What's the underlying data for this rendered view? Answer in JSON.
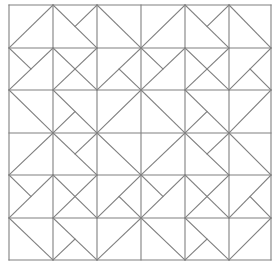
{
  "diagram": {
    "type": "geometric-tiling",
    "grid": {
      "cols": 6,
      "rows": 6,
      "x_lines": [
        9,
        53,
        97,
        141,
        185,
        229,
        271
      ],
      "y_lines": [
        5,
        48,
        90,
        133,
        175,
        218,
        260
      ],
      "line_color": "#808080",
      "background": "#ffffff"
    },
    "pattern_rows_repeat": 2,
    "pattern": [
      [
        {
          "col": 0,
          "lines": [
            [
              "TR",
              "BL"
            ]
          ]
        },
        {
          "col": 1,
          "lines": [
            [
              "TL",
              "BR"
            ],
            [
              "TR",
              "C"
            ]
          ]
        },
        {
          "col": 2,
          "lines": [
            [
              "TL",
              "BR"
            ]
          ]
        },
        {
          "col": 3,
          "lines": [
            [
              "TR",
              "BL"
            ]
          ]
        },
        {
          "col": 4,
          "lines": [
            [
              "TL",
              "BR"
            ],
            [
              "TR",
              "C"
            ]
          ]
        },
        {
          "col": 5,
          "lines": [
            [
              "TL",
              "BR"
            ]
          ]
        }
      ],
      [
        {
          "col": 0,
          "lines": [
            [
              "TL",
              "C"
            ],
            [
              "TR",
              "BL"
            ]
          ]
        },
        {
          "col": 1,
          "lines": [
            [
              "TR",
              "BL"
            ],
            [
              "TL",
              "BR"
            ]
          ]
        },
        {
          "col": 2,
          "lines": [
            [
              "TR",
              "BL"
            ],
            [
              "C",
              "BR"
            ]
          ]
        },
        {
          "col": 3,
          "lines": [
            [
              "TL",
              "C"
            ],
            [
              "TR",
              "BL"
            ]
          ]
        },
        {
          "col": 4,
          "lines": [
            [
              "TR",
              "BL"
            ],
            [
              "TL",
              "BR"
            ]
          ]
        },
        {
          "col": 5,
          "lines": [
            [
              "TR",
              "BL"
            ],
            [
              "C",
              "BR"
            ]
          ]
        }
      ],
      [
        {
          "col": 0,
          "lines": [
            [
              "TL",
              "BR"
            ]
          ]
        },
        {
          "col": 1,
          "lines": [
            [
              "TL",
              "BR"
            ],
            [
              "C",
              "BL"
            ]
          ]
        },
        {
          "col": 2,
          "lines": [
            [
              "TR",
              "BL"
            ]
          ]
        },
        {
          "col": 3,
          "lines": [
            [
              "TL",
              "BR"
            ]
          ]
        },
        {
          "col": 4,
          "lines": [
            [
              "TL",
              "BR"
            ],
            [
              "C",
              "BL"
            ]
          ]
        },
        {
          "col": 5,
          "lines": [
            [
              "TR",
              "BL"
            ]
          ]
        }
      ]
    ]
  }
}
